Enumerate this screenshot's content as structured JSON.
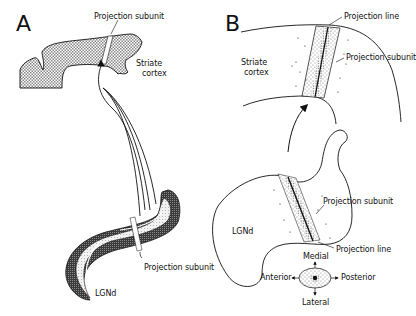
{
  "panels": {
    "A": {
      "letter": "A",
      "labels": {
        "projection_subunit_top": "Projection subunit",
        "striate_line1": "Striate",
        "striate_line2": "cortex",
        "projection_subunit_bottom": "Projection subunit",
        "lgnd": "LGNd"
      }
    },
    "B": {
      "letter": "B",
      "labels": {
        "projection_line_top": "Projection line",
        "projection_subunit_top": "Projection subunit",
        "striate_line1": "Striate",
        "striate_line2": "cortex",
        "projection_subunit_lgn": "Projection subunit",
        "lgnd": "LGNd",
        "projection_line_lgn": "Projection line"
      },
      "orientation": {
        "medial": "Medial",
        "anterior": "Anterior",
        "posterior": "Posterior",
        "lateral": "Lateral"
      }
    }
  },
  "colors": {
    "ink": "#111111",
    "hatch": "#9a9a9a",
    "dark_layer": "#555555",
    "light_layer": "#dcdcdc"
  }
}
